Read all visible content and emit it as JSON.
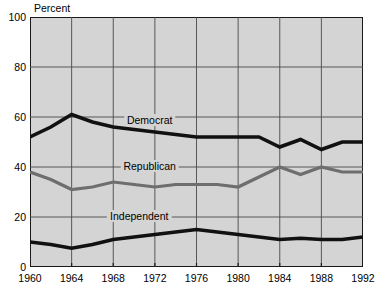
{
  "chart_data": {
    "type": "line",
    "title": "",
    "xlabel": "",
    "ylabel": "Percent",
    "xlim": [
      1960,
      1992
    ],
    "ylim": [
      0,
      100
    ],
    "grid": true,
    "legend_position": "inline-labels",
    "xticks": [
      "1960",
      "1964",
      "1968",
      "1972",
      "1976",
      "1980",
      "1984",
      "1988",
      "1992"
    ],
    "yticks": [
      "0",
      "20",
      "40",
      "60",
      "80",
      "100"
    ],
    "x": [
      1960,
      1962,
      1964,
      1966,
      1968,
      1970,
      1972,
      1974,
      1976,
      1978,
      1980,
      1982,
      1984,
      1986,
      1988,
      1990,
      1992
    ],
    "series": [
      {
        "name": "Democrat",
        "color": "#111111",
        "width": 3.6,
        "values": [
          52,
          56,
          61,
          58,
          56,
          55,
          54,
          53,
          52,
          52,
          52,
          52,
          48,
          51,
          47,
          50,
          50
        ]
      },
      {
        "name": "Republican",
        "color": "#6e6e6e",
        "width": 3.2,
        "values": [
          38,
          35,
          31,
          32,
          34,
          33,
          32,
          33,
          33,
          33,
          32,
          36,
          40,
          37,
          40,
          38,
          38
        ]
      },
      {
        "name": "Independent",
        "color": "#111111",
        "width": 3.6,
        "values": [
          10,
          9,
          7.5,
          9,
          11,
          12,
          13,
          14,
          15,
          14,
          13,
          12,
          11,
          11.5,
          11,
          11,
          12
        ]
      }
    ],
    "annotations": [
      {
        "text": "Democrat",
        "x": 1971.5,
        "y": 58.5
      },
      {
        "text": "Republican",
        "x": 1971.5,
        "y": 40
      },
      {
        "text": "Independent",
        "x": 1970.5,
        "y": 20
      }
    ]
  }
}
